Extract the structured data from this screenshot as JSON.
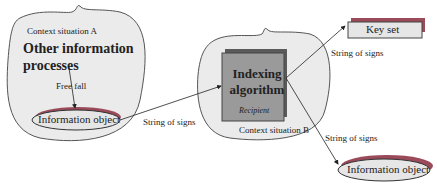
{
  "context_a": {
    "label": "Context situation A",
    "title_line1": "Other information",
    "title_line2": "processes",
    "free_fall": "Free   fall",
    "object": "Information object"
  },
  "arrow_a_b": "String of signs",
  "context_b": {
    "label": "Context situation B",
    "algo_line1": "Indexing",
    "algo_line2": "algorithm",
    "recipient": "Recipient"
  },
  "key_set": "Key set",
  "arrow_to_keyset": "String of signs",
  "arrow_to_object": "String of signs",
  "output_object": "Information object",
  "colors": {
    "blob_fill": "#ebebeb",
    "algo_fill": "#9a9a9a",
    "shadow": "#5a5a5a",
    "accent_shadow": "#9b4a5a"
  }
}
